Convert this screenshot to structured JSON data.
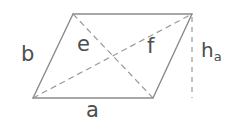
{
  "figure": {
    "kind": "geometry-diagram",
    "shape": "parallelogram",
    "background_color": "#ffffff",
    "stroke_color": "#808080",
    "label_color": "#4d4d4d",
    "labels": {
      "base": "a",
      "side": "b",
      "diagonal_1": "e",
      "diagonal_2": "f",
      "height_letter": "h",
      "height_subscript": "a"
    },
    "vertices": {
      "top_left": [
        73,
        14
      ],
      "top_right": [
        192,
        14
      ],
      "bottom_right": [
        153,
        98
      ],
      "bottom_left": [
        33,
        98
      ]
    },
    "edges": [
      {
        "name": "top-edge",
        "from": [
          73,
          14
        ],
        "to": [
          192,
          14
        ],
        "style": "solid"
      },
      {
        "name": "right-edge",
        "from": [
          192,
          14
        ],
        "to": [
          153,
          98
        ],
        "style": "solid"
      },
      {
        "name": "bottom-edge",
        "from": [
          153,
          98
        ],
        "to": [
          33,
          98
        ],
        "style": "solid"
      },
      {
        "name": "left-edge",
        "from": [
          33,
          98
        ],
        "to": [
          73,
          14
        ],
        "style": "solid"
      }
    ],
    "diagonals": [
      {
        "name": "diagonal-e",
        "from": [
          73,
          14
        ],
        "to": [
          153,
          98
        ],
        "style": "dashed"
      },
      {
        "name": "diagonal-f",
        "from": [
          33,
          98
        ],
        "to": [
          192,
          14
        ],
        "style": "dashed"
      }
    ],
    "height_line": {
      "name": "height-line",
      "from": [
        192,
        17
      ],
      "to": [
        192,
        98
      ],
      "style": "dashed"
    }
  }
}
